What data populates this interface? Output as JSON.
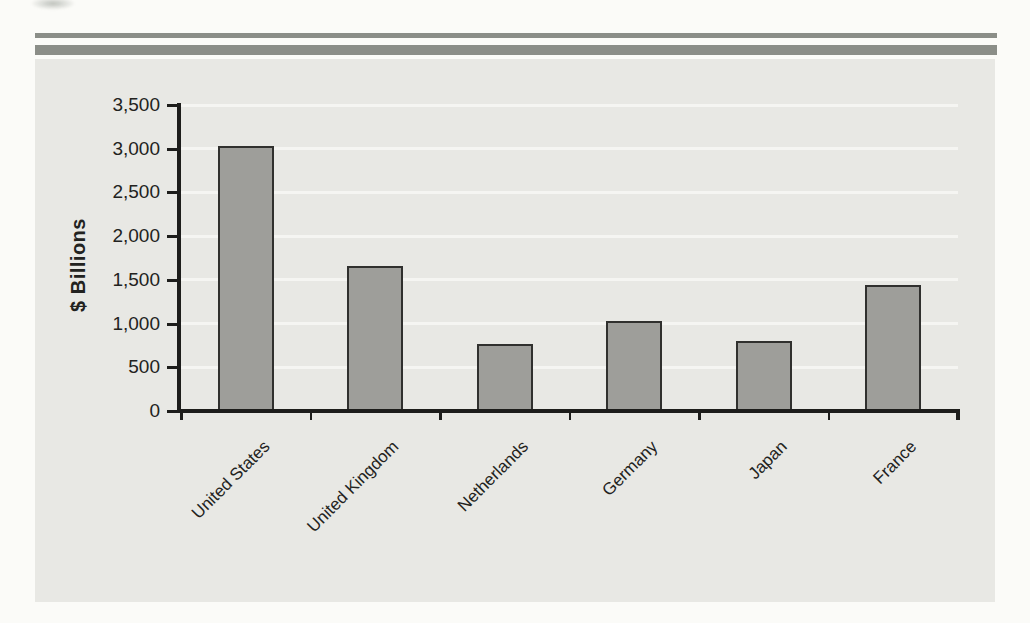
{
  "colors": {
    "page_background": "#fbfbf8",
    "panel_background": "#e8e8e4",
    "top_rule": "#8b8e88",
    "gridline": "#f5f5f2",
    "axis": "#1d1d1b",
    "axis_text": "#222220",
    "bar_fill": "#9e9e9a",
    "bar_border": "#30302e"
  },
  "chart_data": {
    "type": "bar",
    "categories": [
      "United States",
      "United Kingdom",
      "Netherlands",
      "Germany",
      "Japan",
      "France"
    ],
    "values": [
      3030,
      1660,
      770,
      1030,
      800,
      1440
    ],
    "title": "",
    "xlabel": "",
    "ylabel": "$ Billions",
    "ylim": [
      0,
      3500
    ],
    "ytick_interval": 500,
    "ytick_labels": [
      "0",
      "500",
      "1,000",
      "1,500",
      "2,000",
      "2,500",
      "3,000",
      "3,500"
    ],
    "grid": "horizontal",
    "legend": "none",
    "category_label_rotation_deg": -45
  }
}
